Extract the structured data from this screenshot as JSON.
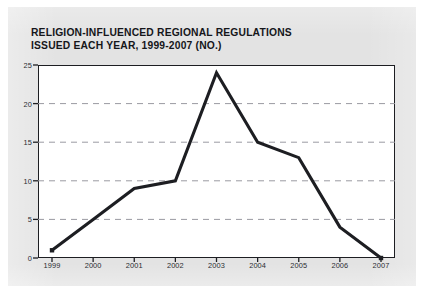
{
  "chart_data": {
    "type": "line",
    "title": "RELIGION-INFLUENCED REGIONAL REGULATIONS ISSUED EACH YEAR, 1999-2007 (NO.)",
    "title_lines": [
      "RELIGION-INFLUENCED REGIONAL REGULATIONS",
      "ISSUED EACH YEAR, 1999-2007 (NO.)"
    ],
    "categories": [
      "1999",
      "2000",
      "2001",
      "2002",
      "2003",
      "2004",
      "2005",
      "2006",
      "2007"
    ],
    "values": [
      1,
      5,
      9,
      10,
      24,
      15,
      13,
      4,
      0
    ],
    "series": [
      {
        "name": "Regulations issued",
        "values": [
          1,
          5,
          9,
          10,
          24,
          15,
          13,
          4,
          0
        ]
      }
    ],
    "xlabel": "",
    "ylabel": "",
    "ylim": [
      0,
      25
    ],
    "y_ticks": [
      0,
      5,
      10,
      15,
      20,
      25
    ],
    "y_tick_labels": [
      "0",
      "5",
      "10",
      "15",
      "20",
      "25"
    ],
    "x_tick_labels": [
      "1999",
      "2000",
      "2001",
      "2002",
      "2003",
      "2004",
      "2005",
      "2006",
      "2007"
    ],
    "grid": true,
    "grid_style": "dashed-horizontal",
    "legend": false,
    "legend_position": "none",
    "colors": {
      "line": "#1d1e22",
      "marker": "#1d1e22",
      "grid": "#9a9aa2",
      "axis": "#1d1e22",
      "plot_background": "#ffffff",
      "page_background": "#e3e3e3",
      "title_text": "#15161a",
      "tick_text": "#2b2d32"
    },
    "markers": {
      "1999": "square",
      "2007": "square"
    }
  }
}
